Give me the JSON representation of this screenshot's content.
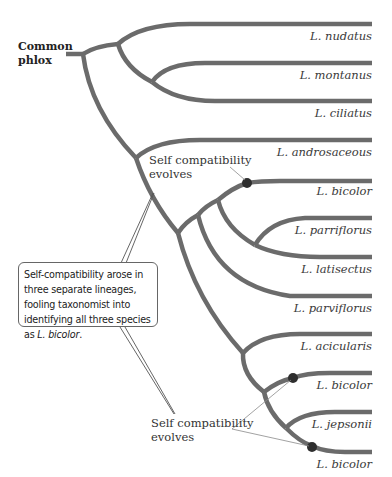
{
  "root": {
    "label_line1": "Common",
    "label_line2": "phlox"
  },
  "taxa": [
    {
      "name": "L. nudatus",
      "y": 24,
      "label_top": 29
    },
    {
      "name": "L. montanus",
      "y": 63,
      "label_top": 68
    },
    {
      "name": "L. ciliatus",
      "y": 101,
      "label_top": 106
    },
    {
      "name": "L. androsaceous",
      "y": 140,
      "label_top": 145
    },
    {
      "name": "L. bicolor",
      "y": 181,
      "label_top": 184
    },
    {
      "name": "L. parriflorus",
      "y": 218,
      "label_top": 223
    },
    {
      "name": "L. latisectus",
      "y": 257,
      "label_top": 262
    },
    {
      "name": "L. parviflorus",
      "y": 296,
      "label_top": 301
    },
    {
      "name": "L. acicularis",
      "y": 334,
      "label_top": 339
    },
    {
      "name": "L. bicolor",
      "y": 373,
      "label_top": 378
    },
    {
      "name": "L. jepsonii",
      "y": 412,
      "label_top": 417
    },
    {
      "name": "L. bicolor",
      "y": 452,
      "label_top": 457
    }
  ],
  "annotations": {
    "top_evolves": {
      "line1": "Self compatibility",
      "line2": "evolves"
    },
    "bottom_evolves": {
      "line1": "Self compatibility",
      "line2": "evolves"
    },
    "callout": {
      "text_before": "Self-compatibility arose in three separate lineages, fooling taxonomist into identifying all three species as ",
      "italic": "L. bicolor",
      "text_after": "."
    }
  },
  "colors": {
    "branch": "#6b6b6b",
    "dot": "#2e2e2e",
    "text": "#3a3a3a"
  }
}
